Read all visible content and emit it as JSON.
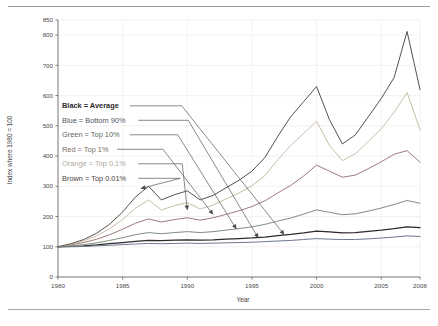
{
  "figure": {
    "background": "#ffffff",
    "rule_color": "#9a9a9a"
  },
  "chart_data": {
    "type": "line",
    "title": "",
    "xlabel": "Year",
    "ylabel": "Index where 1980 = 100",
    "xlim": [
      1980,
      2008
    ],
    "ylim": [
      0,
      850
    ],
    "grid": true,
    "legend_position": "inside-left",
    "xticks": [
      "1980",
      "1985",
      "1990",
      "1995",
      "2000",
      "2005",
      "2008"
    ],
    "xtick_values": [
      1980,
      1985,
      1990,
      1995,
      2000,
      2005,
      2008
    ],
    "yticks": [
      "0",
      "100",
      "200",
      "300",
      "400",
      "500",
      "600",
      "700",
      "800",
      "850"
    ],
    "ytick_values": [
      0,
      100,
      200,
      300,
      400,
      500,
      600,
      700,
      800,
      850
    ],
    "x": [
      1980,
      1981,
      1982,
      1983,
      1984,
      1985,
      1986,
      1987,
      1988,
      1989,
      1990,
      1991,
      1992,
      1993,
      1994,
      1995,
      1996,
      1997,
      1998,
      1999,
      2000,
      2001,
      2002,
      2003,
      2004,
      2005,
      2006,
      2007,
      2008
    ],
    "series": [
      {
        "name": "Average",
        "legend_label": "Black = Average",
        "color": "#2b2b2b",
        "values": [
          100,
          101,
          103,
          106,
          110,
          114,
          118,
          121,
          120,
          122,
          123,
          122,
          123,
          125,
          127,
          129,
          132,
          137,
          141,
          146,
          152,
          149,
          146,
          147,
          151,
          155,
          160,
          166,
          163
        ]
      },
      {
        "name": "Bottom 90%",
        "legend_label": "Blue = Bottom 90%",
        "color": "#6e7a8f",
        "values": [
          100,
          100,
          101,
          103,
          105,
          107,
          109,
          111,
          110,
          111,
          112,
          111,
          112,
          113,
          114,
          115,
          117,
          119,
          121,
          124,
          127,
          125,
          124,
          124,
          126,
          129,
          132,
          136,
          134
        ]
      },
      {
        "name": "Top 10%",
        "legend_label": "Green = Top 10%",
        "color": "#7d8f7e",
        "values": [
          100,
          103,
          107,
          113,
          121,
          130,
          140,
          147,
          143,
          147,
          150,
          147,
          150,
          155,
          160,
          166,
          174,
          185,
          195,
          208,
          222,
          214,
          206,
          209,
          218,
          228,
          240,
          253,
          244
        ]
      },
      {
        "name": "Top 1%",
        "legend_label": "Red = Top 1%",
        "color": "#a07b7b",
        "values": [
          100,
          106,
          114,
          125,
          140,
          158,
          178,
          192,
          182,
          190,
          196,
          188,
          196,
          207,
          219,
          233,
          252,
          278,
          303,
          334,
          370,
          350,
          330,
          337,
          358,
          381,
          406,
          418,
          380
        ]
      },
      {
        "name": "Top 0.1%",
        "legend_label": "Orange = Top 0.1%",
        "color": "#c9bda8"
      },
      {
        "name": "Top 0.01%",
        "legend_label": "Brown = Top 0.01%",
        "color": "#575049",
        "values": [
          100,
          110,
          124,
          145,
          175,
          215,
          265,
          300,
          255,
          272,
          285,
          255,
          270,
          295,
          320,
          350,
          395,
          465,
          530,
          580,
          630,
          520,
          440,
          470,
          530,
          590,
          660,
          812,
          620
        ]
      }
    ],
    "series_orange_values": [
      100,
      108,
      119,
      136,
      160,
      190,
      228,
      255,
      222,
      236,
      246,
      225,
      238,
      258,
      278,
      302,
      335,
      388,
      435,
      475,
      515,
      435,
      385,
      408,
      448,
      490,
      545,
      610,
      487
    ],
    "annotations": [
      {
        "label": "Black = Average",
        "arrow_to_year": 1997.5,
        "arrow_to_value": 133
      },
      {
        "label": "Blue = Bottom 90%",
        "arrow_to_year": 1995.5,
        "arrow_to_value": 122
      },
      {
        "label": "Green = Top 10%",
        "arrow_to_year": 1993.8,
        "arrow_to_value": 152
      },
      {
        "label": "Red = Top 1%",
        "arrow_to_year": 1992.0,
        "arrow_to_value": 200
      },
      {
        "label": "Orange = Top 0.1%",
        "arrow_to_year": 1990.0,
        "arrow_to_value": 215
      },
      {
        "label": "Brown = Top 0.01%",
        "arrow_to_year": 1986.4,
        "arrow_to_value": 286
      }
    ]
  }
}
